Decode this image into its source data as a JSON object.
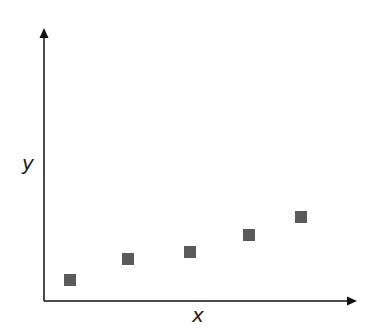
{
  "chart_data": {
    "type": "scatter",
    "title": "",
    "xlabel": "x",
    "ylabel": "y",
    "grid": false,
    "legend": null,
    "x": [
      1,
      2,
      3,
      4,
      5
    ],
    "y": [
      0.8,
      1.6,
      1.9,
      2.5,
      3.1
    ],
    "marker": "square",
    "marker_color": "#5a5a5a",
    "axis_color": "#111111",
    "pixel_points": [
      [
        70,
        280
      ],
      [
        128,
        259
      ],
      [
        190,
        252
      ],
      [
        249,
        235
      ],
      [
        301,
        217
      ]
    ]
  },
  "labels": {
    "x": "x",
    "y": "y"
  }
}
